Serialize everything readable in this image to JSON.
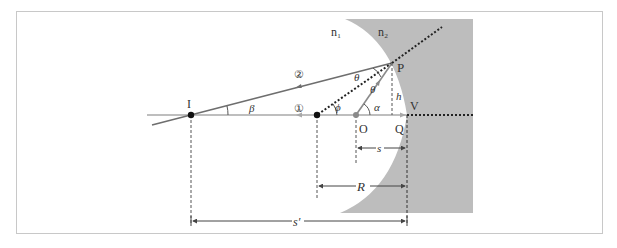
{
  "diagram": {
    "media": {
      "n1": "n₁",
      "n2": "n₂"
    },
    "points": {
      "I": "I",
      "P": "P",
      "O": "O",
      "Q": "Q",
      "V": "V"
    },
    "angles": {
      "theta_upper": "θ",
      "theta_lower": "θ",
      "phi": "ϕ",
      "alpha": "α",
      "beta": "β"
    },
    "rays": {
      "ray1": "①",
      "ray2": "②"
    },
    "lengths": {
      "h": "h",
      "s": "s",
      "R": "R",
      "s_prime": "s′"
    },
    "colors": {
      "medium2": "#bdbdbd",
      "ray": "#6e6e6e",
      "axis": "#a8a8a8",
      "dashed": "#333333",
      "point": "#111111",
      "center": "#8a8a8a"
    }
  }
}
